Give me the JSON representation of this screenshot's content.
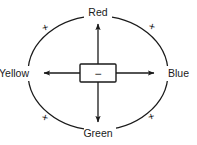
{
  "diagram": {
    "center": {
      "sign": "−",
      "sign_name": "minus",
      "box_fill": "#ffffff",
      "box_stroke": "#1a1a1a"
    },
    "stroke_color": "#1a1a1a",
    "background_color": "#ffffff",
    "axis_labels": [
      {
        "id": "red",
        "text": "Red",
        "position": "top"
      },
      {
        "id": "blue",
        "text": "Blue",
        "position": "right"
      },
      {
        "id": "green",
        "text": "Green",
        "position": "bottom"
      },
      {
        "id": "yellow",
        "text": "Yellow",
        "position": "left"
      }
    ],
    "diagonal_signs": [
      {
        "id": "sign-top-left",
        "text": "+",
        "position": "top-left"
      },
      {
        "id": "sign-top-right",
        "text": "+",
        "position": "top-right"
      },
      {
        "id": "sign-bottom-left",
        "text": "+",
        "position": "bottom-left"
      },
      {
        "id": "sign-bottom-right",
        "text": "+",
        "position": "bottom-right"
      }
    ]
  }
}
